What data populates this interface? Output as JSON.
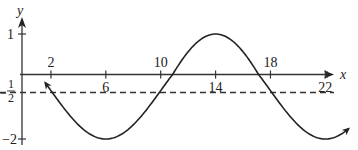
{
  "chart_data": {
    "type": "line",
    "title": "",
    "xlabel": "x",
    "ylabel": "y",
    "x_ticks": [
      2,
      6,
      10,
      14,
      18,
      22
    ],
    "x_tick_labels": [
      "2",
      "6",
      "10",
      "14",
      "18",
      "22"
    ],
    "y_ticks": [
      1,
      -2
    ],
    "y_tick_labels": [
      "1",
      "−2"
    ],
    "y_special_label": {
      "value": -0.5,
      "numerator": "1",
      "denominator": "2",
      "sign": "−"
    },
    "dashed_line": {
      "y": -0.5,
      "description": "midline y = -1/2"
    },
    "function": "y = -1/2 + 1.5 sin(pi (x - 10) / 8)",
    "x_range": [
      1.5,
      24
    ],
    "series": [
      {
        "name": "curve",
        "x": [
          1.5,
          2,
          4,
          6,
          8,
          10,
          12,
          14,
          16,
          18,
          20,
          22,
          24
        ],
        "y": [
          -0.36,
          -0.5,
          -1.56,
          -2.0,
          -1.56,
          -0.5,
          0.56,
          1.0,
          0.56,
          -0.5,
          -1.56,
          -2.0,
          -1.56
        ]
      }
    ],
    "grid": false,
    "legend": null,
    "arrows": {
      "curve_ends": true,
      "x_axis": true,
      "y_axis": true
    }
  }
}
